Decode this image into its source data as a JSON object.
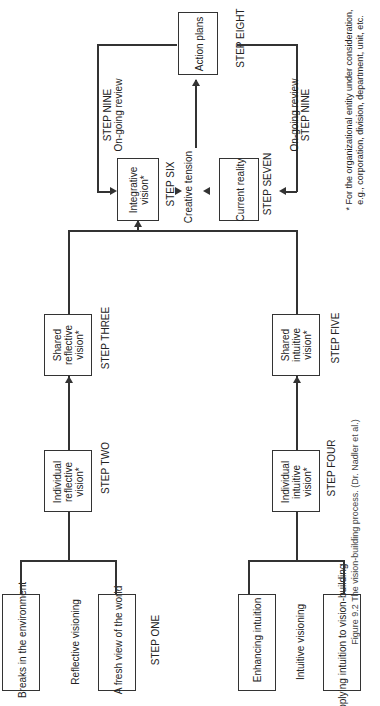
{
  "reflective": {
    "inputs": [
      "Breaks in the environment",
      "A fresh view of the world"
    ],
    "process": "Reflective visioning",
    "step": "STEP ONE",
    "individual": "Individual reflective vision*",
    "individual_step": "STEP TWO",
    "shared": "Shared reflective vision*",
    "shared_step": "STEP THREE"
  },
  "intuitive": {
    "inputs": [
      "Enhancing intuition",
      "Applying intuition to vision-building"
    ],
    "process": "Intuitive visioning",
    "individual": "Individual intuitive vision*",
    "individual_step": "STEP FOUR",
    "shared": "Shared intuitive vision*",
    "shared_step": "STEP FIVE"
  },
  "integration": {
    "integrative": "Integrative vision*",
    "integrative_step": "STEP SIX",
    "tension": "Creative tension",
    "current": "Current reality",
    "current_step": "STEP SEVEN",
    "action": "Action plans",
    "action_step": "STEP EIGHT",
    "review_top": [
      "STEP NINE",
      "On-going review"
    ],
    "review_bottom": [
      "On-going review",
      "STEP NINE"
    ]
  },
  "footnote": [
    "* For the organizational entity under consideration,",
    "e.g., corporation, division, department, unit, etc."
  ],
  "caption": "Figure 9.2   The vision-building process. (Dr. Nadler et al.)"
}
